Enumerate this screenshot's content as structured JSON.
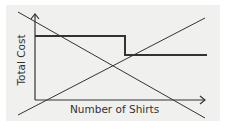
{
  "diagram": {
    "x_axis_label": "Number of Shirts",
    "y_axis_label": "Total Cost",
    "elements": [
      {
        "type": "axis",
        "name": "x-axis",
        "from": [
          35,
          100
        ],
        "to": [
          205,
          100
        ],
        "arrow": true
      },
      {
        "type": "axis",
        "name": "y-axis",
        "from": [
          35,
          100
        ],
        "to": [
          35,
          15
        ],
        "arrow": true
      },
      {
        "type": "step-line",
        "name": "flat-rate-cost",
        "points": [
          [
            35,
            36
          ],
          [
            125,
            36
          ],
          [
            125,
            55
          ],
          [
            207,
            55
          ]
        ]
      },
      {
        "type": "line",
        "name": "decreasing-line",
        "from": [
          18,
          12
        ],
        "to": [
          205,
          118
        ]
      },
      {
        "type": "line",
        "name": "increasing-line",
        "from": [
          18,
          115
        ],
        "to": [
          205,
          18
        ]
      }
    ],
    "colors": {
      "background": "#f0f0ee",
      "line": "#333333",
      "text": "#333333"
    }
  }
}
